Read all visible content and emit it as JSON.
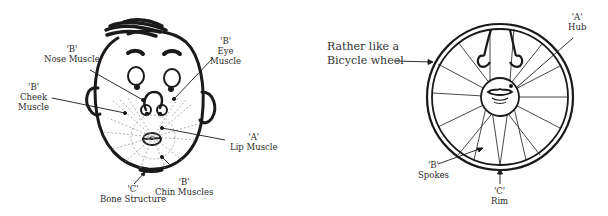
{
  "face_diagram": {
    "labels": {
      "nose_muscle": {
        "code": "'B'",
        "name": "Nose Muscle"
      },
      "eye_muscle": {
        "code": "'B'",
        "name1": "Eye",
        "name2": "Muscle"
      },
      "cheek_muscle": {
        "code": "'B'",
        "name1": "Cheek",
        "name2": "Muscle"
      },
      "lip_muscle": {
        "code": "'A'",
        "name": "Lip Muscle"
      },
      "chin_muscles": {
        "code": "'B'",
        "name": "Chin Muscles"
      },
      "bone_structure": {
        "code": "'C'",
        "name": "Bone Structure"
      }
    }
  },
  "wheel_diagram": {
    "caption_line1": "Rather like a",
    "caption_line2": "Bicycle wheel",
    "labels": {
      "hub": {
        "code": "'A'",
        "name": "Hub"
      },
      "spokes": {
        "code": "'B'",
        "name": "Spokes"
      },
      "rim": {
        "code": "'C'",
        "name": "Rim"
      }
    }
  },
  "colors": {
    "ink": "#1a1a1a",
    "dashed": "#9a9a9a",
    "background": "#ffffff"
  }
}
